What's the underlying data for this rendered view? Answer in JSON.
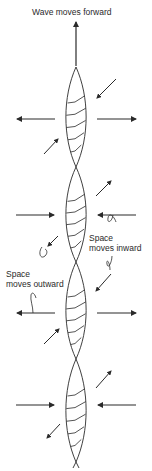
{
  "diagram": {
    "title": "Wave moves forward",
    "labels": {
      "inward": [
        "Space",
        "moves inward"
      ],
      "outward": [
        "Space",
        "moves outward"
      ]
    },
    "colors": {
      "stroke": "#2a2a2a",
      "background": "#ffffff"
    },
    "axis_x": 76,
    "crossings_y": [
      67,
      167,
      262,
      359,
      462
    ],
    "lobe_half_width": 10,
    "horizontal_arrows": [
      {
        "y": 119,
        "direction": "outward"
      },
      {
        "y": 215,
        "direction": "inward"
      },
      {
        "y": 313,
        "direction": "outward"
      },
      {
        "y": 405,
        "direction": "inward"
      }
    ],
    "diagonal_arrows": [
      {
        "x1": 116,
        "y1": 79,
        "x2": 97,
        "y2": 98,
        "note": "inward toward upper lobe"
      },
      {
        "x1": 44,
        "y1": 154,
        "x2": 58,
        "y2": 139,
        "note": "outward"
      },
      {
        "x1": 96,
        "y1": 196,
        "x2": 111,
        "y2": 181,
        "note": "outward"
      },
      {
        "x1": 58,
        "y1": 236,
        "x2": 48,
        "y2": 246,
        "note": "outward"
      },
      {
        "x1": 111,
        "y1": 274,
        "x2": 96,
        "y2": 291,
        "note": "inward"
      },
      {
        "x1": 44,
        "y1": 344,
        "x2": 59,
        "y2": 329,
        "note": "outward"
      },
      {
        "x1": 96,
        "y1": 388,
        "x2": 111,
        "y2": 371,
        "note": "outward"
      },
      {
        "x1": 60,
        "y1": 424,
        "x2": 47,
        "y2": 438,
        "note": "outward"
      }
    ]
  }
}
